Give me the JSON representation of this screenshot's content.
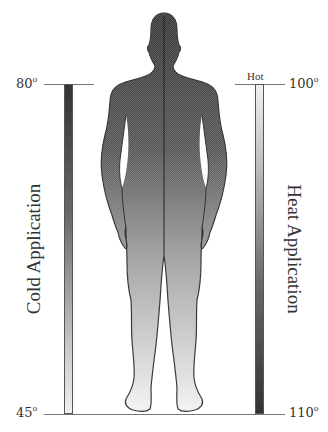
{
  "diagram": {
    "type": "human-body-temperature-scale",
    "left_scale": {
      "title": "Cold Application",
      "top_value": "80",
      "bottom_value": "45",
      "unit_symbol": "o",
      "gradient": [
        "#333333",
        "#f0f0f0"
      ]
    },
    "right_scale": {
      "title": "Heat Application",
      "marker_label": "Hot",
      "top_value": "100",
      "bottom_value": "110",
      "unit_symbol": "o",
      "gradient": [
        "#f0f0f0",
        "#333333"
      ]
    },
    "figure": {
      "description": "front-view human silhouette shaded dark at head to light at feet",
      "gradient": [
        "#3a3a3a",
        "#f2f2f2"
      ],
      "outline_color": "#333333"
    }
  }
}
